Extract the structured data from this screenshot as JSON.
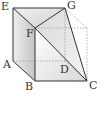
{
  "diagram": {
    "type": "geometry-solid",
    "labels": {
      "E": "E",
      "G": "G",
      "F": "F",
      "A": "A",
      "B": "B",
      "C": "C",
      "D": "D"
    },
    "points": {
      "E": [
        13,
        8
      ],
      "G": [
        65,
        8
      ],
      "F": [
        35,
        28
      ],
      "A": [
        13,
        61
      ],
      "B": [
        35,
        81
      ],
      "C": [
        87,
        81
      ],
      "D": [
        65,
        61
      ],
      "H": [
        87,
        28
      ]
    },
    "colors": {
      "solid_edge": "#333333",
      "hidden_edge": "#999999",
      "face_light": "#e4e4e4",
      "face_dark": "#c8c8c8"
    }
  }
}
